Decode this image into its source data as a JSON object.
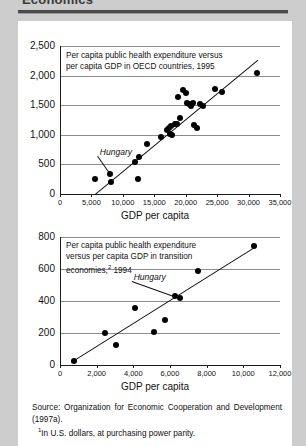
{
  "page": {
    "heading": "Economics"
  },
  "source": {
    "main": "Source: Organization for Economic Cooperation and Development (1997a).",
    "footnote1": "In U.S. dollars, at purchasing power parity.",
    "footnote1_marker": "1"
  },
  "chart_data": [
    {
      "id": "oecd",
      "type": "scatter",
      "title": "Per capita public health expenditure versus per capita GDP in OECD countries, 1995",
      "title_line1": "Per capita public health expenditure versus",
      "title_line2": "per capita GDP in OECD countries, 1995",
      "xlabel": "GDP per capita",
      "ylabel": "",
      "xlim": [
        0,
        35000
      ],
      "ylim": [
        0,
        2500
      ],
      "xticks": [
        0,
        5000,
        10000,
        15000,
        20000,
        25000,
        30000,
        35000
      ],
      "xticklabels": [
        "0",
        "5,000",
        "10,000",
        "15,000",
        "20,000",
        "25,000",
        "30,000",
        "35,000"
      ],
      "yticks": [
        0,
        500,
        1000,
        1500,
        2000,
        2500
      ],
      "yticklabels": [
        "0",
        "500",
        "1,000",
        "1,500",
        "2,000",
        "2,500"
      ],
      "grid": true,
      "legend": "none",
      "annotations": [
        {
          "label": "Hungary",
          "x": 8000,
          "y": 340,
          "label_x": 9200,
          "label_y": 690
        }
      ],
      "trendline": {
        "x0": 5600,
        "y0": 0,
        "x1": 31500,
        "y1": 2270
      },
      "points": [
        {
          "x": 5600,
          "y": 250
        },
        {
          "x": 8000,
          "y": 340
        },
        {
          "x": 8100,
          "y": 200
        },
        {
          "x": 12400,
          "y": 255
        },
        {
          "x": 11900,
          "y": 540
        },
        {
          "x": 12600,
          "y": 630
        },
        {
          "x": 13900,
          "y": 845
        },
        {
          "x": 16000,
          "y": 965
        },
        {
          "x": 17000,
          "y": 1080
        },
        {
          "x": 17300,
          "y": 1120
        },
        {
          "x": 17600,
          "y": 1155
        },
        {
          "x": 17500,
          "y": 1010
        },
        {
          "x": 17800,
          "y": 1000
        },
        {
          "x": 18300,
          "y": 1190
        },
        {
          "x": 18600,
          "y": 1185
        },
        {
          "x": 18800,
          "y": 1640
        },
        {
          "x": 19100,
          "y": 1290
        },
        {
          "x": 19500,
          "y": 1760
        },
        {
          "x": 20000,
          "y": 1700
        },
        {
          "x": 20200,
          "y": 1530
        },
        {
          "x": 20500,
          "y": 1520
        },
        {
          "x": 20900,
          "y": 1490
        },
        {
          "x": 21100,
          "y": 1540
        },
        {
          "x": 21300,
          "y": 1160
        },
        {
          "x": 21800,
          "y": 1120
        },
        {
          "x": 22200,
          "y": 1520
        },
        {
          "x": 22700,
          "y": 1490
        },
        {
          "x": 24600,
          "y": 1780
        },
        {
          "x": 25700,
          "y": 1730
        },
        {
          "x": 31400,
          "y": 2040
        }
      ]
    },
    {
      "id": "transition",
      "type": "scatter",
      "title": "Per capita public health expenditure versus per capita GDP in transition economies, 1994",
      "title_line1": "Per capita public health expenditure",
      "title_line2": "versus per capita GDP in transition",
      "title_line3": "economies,",
      "title_marker": "2",
      "title_line3b": " 1994",
      "xlabel": "GDP per capita",
      "ylabel": "",
      "xlim": [
        0,
        12000
      ],
      "ylim": [
        0,
        800
      ],
      "xticks": [
        0,
        2000,
        4000,
        6000,
        8000,
        10000,
        12000
      ],
      "xticklabels": [
        "0",
        "2,000",
        "4,000",
        "6,000",
        "8,000",
        "10,000",
        "12,000"
      ],
      "yticks": [
        0,
        200,
        400,
        600,
        800
      ],
      "yticklabels": [
        "0",
        "200",
        "400",
        "600",
        "800"
      ],
      "grid": true,
      "legend": "none",
      "annotations": [
        {
          "label": "Hungary",
          "x": 6250,
          "y": 430,
          "label_x": 5000,
          "label_y": 545
        }
      ],
      "trendline": {
        "x0": 600,
        "y0": 20,
        "x1": 10700,
        "y1": 745
      },
      "points": [
        {
          "x": 750,
          "y": 25
        },
        {
          "x": 2450,
          "y": 200
        },
        {
          "x": 3050,
          "y": 125
        },
        {
          "x": 4100,
          "y": 355
        },
        {
          "x": 5150,
          "y": 205
        },
        {
          "x": 5700,
          "y": 280
        },
        {
          "x": 6250,
          "y": 430
        },
        {
          "x": 6550,
          "y": 420
        },
        {
          "x": 7550,
          "y": 590
        },
        {
          "x": 10600,
          "y": 745
        }
      ]
    }
  ]
}
